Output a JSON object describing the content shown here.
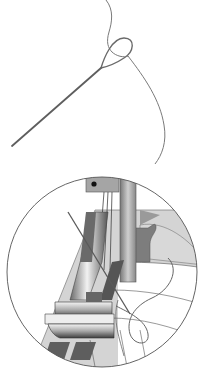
{
  "illustration": {
    "description": "Threaded needle above a circular magnified view of a sewing machine needle and presser foot with thread loop",
    "alt_text": "Needle and thread illustration with magnified presser foot detail",
    "colors": {
      "background": "#ffffff",
      "outline": "#555555",
      "needle": "#6a6a6a",
      "thread": "#7a7a7a",
      "light_gray": "#d2d2d2",
      "mid_gray": "#9a9a9a",
      "dark_gray": "#5e5e5e",
      "metal_highlight": "#f0f0f0"
    },
    "parts": [
      {
        "id": "needle",
        "label": "needle"
      },
      {
        "id": "thread",
        "label": "thread"
      },
      {
        "id": "magnifier-circle",
        "label": "magnified detail"
      },
      {
        "id": "presser-foot",
        "label": "presser foot"
      },
      {
        "id": "needle-clamp",
        "label": "needle clamp"
      },
      {
        "id": "feed-dogs",
        "label": "feed dogs"
      },
      {
        "id": "fabric",
        "label": "fabric"
      }
    ]
  }
}
